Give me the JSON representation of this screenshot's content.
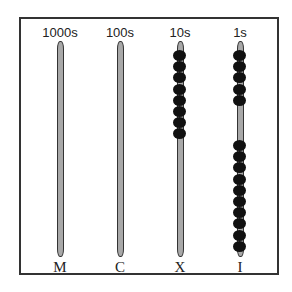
{
  "diagram": {
    "type": "abacus",
    "columns": [
      {
        "place_label": "1000s",
        "roman_label": "M",
        "beads_top": 0,
        "beads_bottom": 0
      },
      {
        "place_label": "100s",
        "roman_label": "C",
        "beads_top": 0,
        "beads_bottom": 0
      },
      {
        "place_label": "10s",
        "roman_label": "X",
        "beads_top": 8,
        "beads_bottom": 0
      },
      {
        "place_label": "1s",
        "roman_label": "I",
        "beads_top": 5,
        "beads_bottom": 10
      }
    ],
    "colors": {
      "rod": "#a8a8a8",
      "bead": "#111111",
      "frame": "#333333"
    }
  }
}
